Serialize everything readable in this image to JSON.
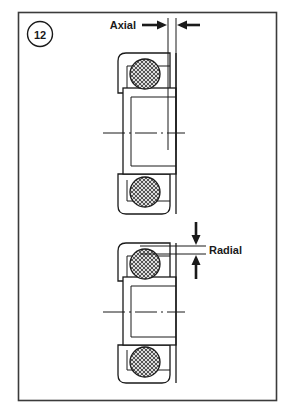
{
  "figure": {
    "number_label": "12",
    "border_color": "#3b3b3b",
    "background_color": "#ffffff",
    "line_color": "#1a1a1a",
    "ball_fill_color": "#d8d8d8"
  },
  "annotations": {
    "axial": {
      "label": "Axial",
      "arrow_direction": "horizontal-inward",
      "measures": "axial clearance (side-to-side play)"
    },
    "radial": {
      "label": "Radial",
      "arrow_direction": "vertical-inward",
      "measures": "radial clearance (up-and-down play)"
    }
  },
  "bearings": [
    {
      "name": "upper-bearing",
      "orientation": "vertical-section",
      "shows": "axial clearance",
      "balls": 2,
      "centerline": "dash-dot"
    },
    {
      "name": "lower-bearing",
      "orientation": "vertical-section",
      "shows": "radial clearance",
      "balls": 2,
      "centerline": "dash-dot"
    }
  ]
}
